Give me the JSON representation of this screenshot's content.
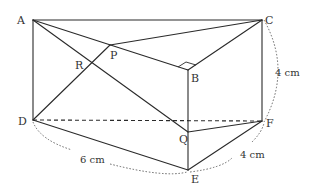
{
  "figure": {
    "type": "triangular-prism",
    "points": {
      "A": {
        "label": "A",
        "x": 33,
        "y": 20
      },
      "C": {
        "label": "C",
        "x": 262,
        "y": 20
      },
      "B": {
        "label": "B",
        "x": 188,
        "y": 70
      },
      "P": {
        "label": "P",
        "x": 110,
        "y": 45
      },
      "R": {
        "label": "R",
        "x": 92,
        "y": 63
      },
      "D": {
        "label": "D",
        "x": 33,
        "y": 120
      },
      "F": {
        "label": "F",
        "x": 262,
        "y": 121
      },
      "E": {
        "label": "E",
        "x": 188,
        "y": 170
      },
      "Q": {
        "label": "Q",
        "x": 188,
        "y": 132
      }
    },
    "dimensions": {
      "CF": "4 cm",
      "DE": "6 cm",
      "EF": "4 cm"
    },
    "right_angle_at": "B"
  }
}
